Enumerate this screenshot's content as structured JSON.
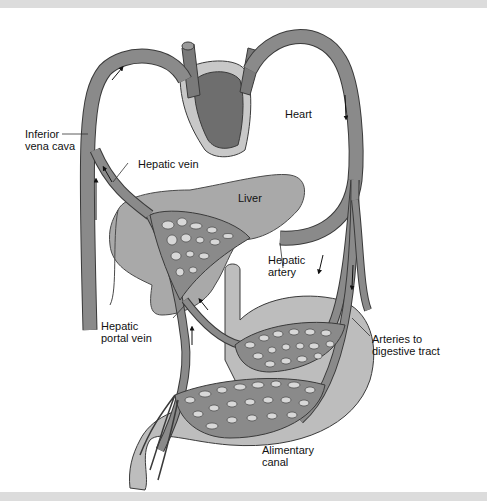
{
  "diagram": {
    "labels": {
      "heart": "Heart",
      "inferior_vena_cava": "Inferior\nvena cava",
      "hepatic_vein": "Hepatic vein",
      "liver": "Liver",
      "hepatic_artery": "Hepatic\nartery",
      "hepatic_portal_vein": "Hepatic\nportal vein",
      "arteries_to_digestive_tract": "Arteries to\ndigestive tract",
      "alimentary_canal": "Alimentary\ncanal"
    },
    "colors": {
      "vessel": "#8a8a8a",
      "vessel_outline": "#3a3a3a",
      "heart_dark": "#6e6e6e",
      "heart_light": "#c8c8c8",
      "organ": "#a9a9a9",
      "canal": "#bdbdbd",
      "background": "#ffffff",
      "frame_band": "#dcdcdc"
    }
  }
}
